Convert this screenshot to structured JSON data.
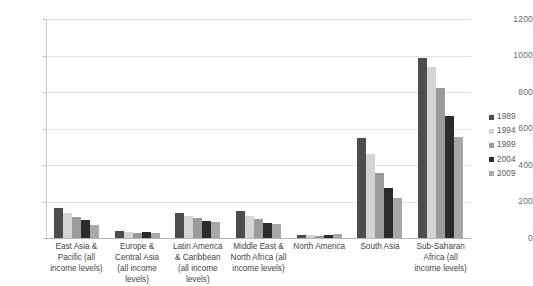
{
  "chart_data": {
    "type": "bar",
    "title": "",
    "subtitle": "",
    "xlabel": "",
    "ylabel": "",
    "ylim": [
      0,
      1200
    ],
    "ytick_step": 200,
    "yticks": [
      0,
      200,
      400,
      600,
      800,
      1000,
      1200
    ],
    "ytick_labels": [
      "0",
      "200",
      "400",
      "600",
      "800",
      "1000",
      "1200"
    ],
    "grid": true,
    "legend_position": "right",
    "categories": [
      "East Asia & Pacific (all income levels)",
      "Europe & Central Asia (all income levels)",
      "Latin America & Caribbean (all income levels)",
      "Middle East & North Africa (all income levels)",
      "North America",
      "South Asia",
      "Sub-Saharan Africa (all income levels)"
    ],
    "series": [
      {
        "name": "1989",
        "color": "#4d4d4d",
        "values": [
          163,
          36,
          138,
          150,
          14,
          548,
          988
        ]
      },
      {
        "name": "1994",
        "color": "#d4d4d4",
        "values": [
          137,
          31,
          122,
          118,
          14,
          462,
          938
        ]
      },
      {
        "name": "1999",
        "color": "#9b9b9b",
        "values": [
          117,
          27,
          112,
          105,
          13,
          358,
          820
        ]
      },
      {
        "name": "2004",
        "color": "#2b2b2b",
        "values": [
          96,
          33,
          93,
          83,
          18,
          272,
          670
        ]
      },
      {
        "name": "2009",
        "color": "#a8a8a8",
        "values": [
          74,
          25,
          88,
          75,
          22,
          219,
          552
        ]
      }
    ]
  },
  "legend": {
    "entries": [
      {
        "label": "1989",
        "color": "#4d4d4d"
      },
      {
        "label": "1994",
        "color": "#d4d4d4"
      },
      {
        "label": "1999",
        "color": "#9b9b9b"
      },
      {
        "label": "2004",
        "color": "#2b2b2b"
      },
      {
        "label": "2009",
        "color": "#a8a8a8"
      }
    ]
  },
  "colors": {
    "background": "#ffffff",
    "gridline": "#e3e3e3",
    "axis": "#bdbdbd",
    "tick_text": "#6b6b6b",
    "label_text": "#444444"
  }
}
